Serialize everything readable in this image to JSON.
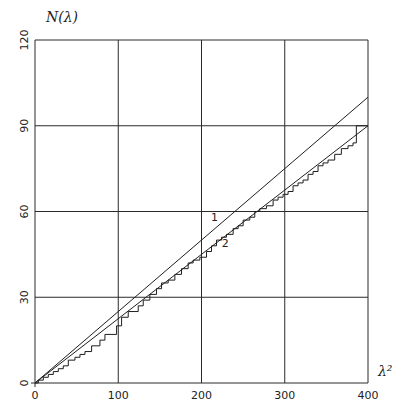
{
  "chart_data": {
    "type": "line",
    "title": "",
    "xlabel": "λ²",
    "ylabel": "N(λ)",
    "xlim": [
      0,
      400
    ],
    "ylim": [
      0,
      120
    ],
    "grid": true,
    "x_ticks": [
      "0",
      "100",
      "200",
      "300",
      "400"
    ],
    "y_ticks": [
      "0",
      "30",
      "60",
      "90",
      "120"
    ],
    "annotations": [
      {
        "text": "1",
        "x": 215,
        "y": 58
      },
      {
        "text": "2",
        "x": 228,
        "y": 49
      }
    ],
    "series": [
      {
        "name": "1",
        "style": "straight line",
        "x": [
          0,
          400
        ],
        "y": [
          0,
          100
        ]
      },
      {
        "name": "2",
        "style": "straight line",
        "x": [
          0,
          400
        ],
        "y": [
          0,
          90
        ]
      },
      {
        "name": "staircase",
        "style": "step",
        "x": [
          4,
          10,
          16,
          22,
          28,
          34,
          40,
          48,
          54,
          60,
          68,
          78,
          84,
          98,
          104,
          112,
          124,
          130,
          138,
          146,
          152,
          160,
          168,
          176,
          184,
          190,
          198,
          206,
          212,
          218,
          224,
          230,
          238,
          244,
          250,
          258,
          264,
          270,
          278,
          286,
          292,
          298,
          304,
          310,
          316,
          322,
          328,
          334,
          340,
          346,
          352,
          360,
          368,
          376,
          382,
          386
        ],
        "y": [
          1,
          2,
          3,
          4,
          5,
          6,
          8,
          9,
          10,
          11,
          13,
          15,
          17,
          20,
          23,
          25,
          27,
          29,
          31,
          33,
          35,
          36,
          38,
          40,
          42,
          43,
          44,
          46,
          48,
          50,
          51,
          52,
          54,
          55,
          57,
          58,
          60,
          61,
          62,
          64,
          65,
          66,
          67,
          69,
          70,
          71,
          73,
          74,
          76,
          77,
          78,
          80,
          82,
          83,
          84,
          90
        ]
      }
    ]
  }
}
